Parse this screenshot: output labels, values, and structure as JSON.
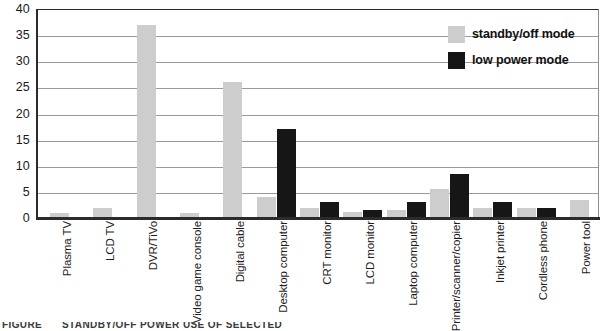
{
  "chart_data": {
    "type": "bar",
    "title": "",
    "xlabel": "",
    "ylabel": "",
    "ylim": [
      0,
      40
    ],
    "yticks": [
      0,
      5,
      10,
      15,
      20,
      25,
      30,
      35,
      40
    ],
    "grid": true,
    "legend_position": "top-right",
    "categories": [
      "Plasma TV",
      "LCD TV",
      "DVR/TiVo",
      "Video game console",
      "Digital cable",
      "Desktop computer",
      "CRT monitor",
      "LCD monitor",
      "Laptop computer",
      "Printer/scanner/copier",
      "Inkjet printer",
      "Cordless phone",
      "Power tool"
    ],
    "series": [
      {
        "name": "standby/off mode",
        "color": "#cdcdcd",
        "values": [
          1,
          2,
          37,
          1,
          26,
          4,
          2,
          1.2,
          1.5,
          5.5,
          2,
          2,
          3.5
        ]
      },
      {
        "name": "low power mode",
        "color": "#161616",
        "values": [
          0,
          0,
          0,
          0,
          0,
          17,
          3,
          1.5,
          3,
          8.5,
          3,
          2,
          0
        ]
      }
    ]
  },
  "legend": {
    "items": [
      {
        "label": "standby/off mode",
        "swatch": "standby"
      },
      {
        "label": "low power mode",
        "swatch": "lowpower"
      }
    ]
  },
  "caption": {
    "figure_label": "FIGURE",
    "title_fragment": "STANDBY/OFF POWER USE OF SELECTED"
  }
}
